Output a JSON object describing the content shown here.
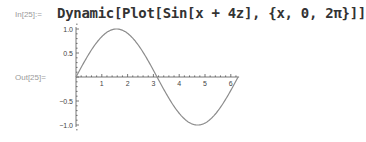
{
  "cell": {
    "input_label": "In[25]:=",
    "output_label": "Out[25]=",
    "input_expression": "Dynamic[Plot[Sin[x + 4z], {x, 0, 2π}]]"
  },
  "chart_data": {
    "type": "line",
    "title": "",
    "xlabel": "",
    "ylabel": "",
    "function": "Sin[x + 4z]",
    "xlim": [
      0,
      6.283
    ],
    "ylim": [
      -1.0,
      1.0
    ],
    "x_ticks": [
      "1",
      "2",
      "3",
      "4",
      "5",
      "6"
    ],
    "y_ticks": [
      "1.0",
      "0.5",
      "-0.5",
      "-1.0"
    ],
    "grid": false,
    "series": [
      {
        "name": "Sin[x]",
        "x": [
          0,
          0.785,
          1.571,
          2.356,
          3.142,
          3.927,
          4.712,
          5.498,
          6.283
        ],
        "values": [
          0,
          0.707,
          1,
          0.707,
          0,
          -0.707,
          -1,
          -0.707,
          0
        ]
      }
    ],
    "line_color": "#8c8c8c"
  }
}
